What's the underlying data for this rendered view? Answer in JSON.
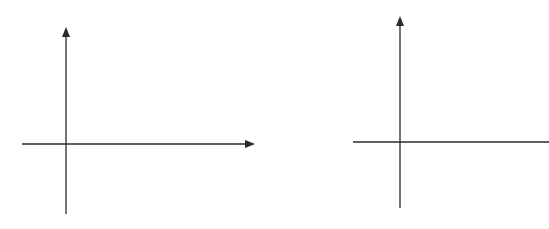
{
  "diagram": {
    "line_color": "#2a2a2a",
    "background": "#ffffff",
    "axes": [
      {
        "name": "left-axes",
        "vertical": {
          "x": 66,
          "y_top": 27,
          "y_bottom": 214,
          "arrow_top": true
        },
        "horizontal": {
          "y": 144,
          "x_left": 22,
          "x_right": 255,
          "arrow_right": true
        }
      },
      {
        "name": "right-axes",
        "vertical": {
          "x": 400,
          "y_top": 16,
          "y_bottom": 208,
          "arrow_top": true
        },
        "horizontal": {
          "y": 142,
          "x_left": 353,
          "x_right": 549,
          "arrow_right": false
        }
      }
    ]
  }
}
